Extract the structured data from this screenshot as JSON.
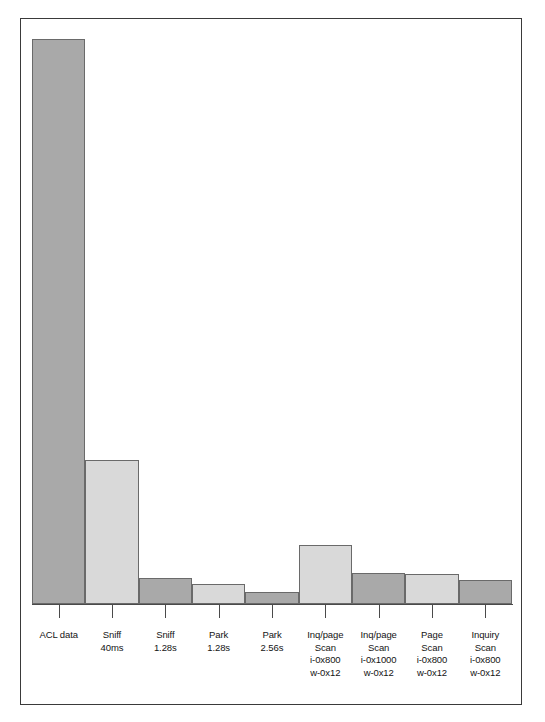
{
  "figure": {
    "background_color": "#ffffff",
    "frame_color": "#3a3a3a",
    "bar_dark_color": "#a9a9a9",
    "bar_light_color": "#d9d9d9",
    "bar_edge_color": "#6a6a6a",
    "axis_color": "#4a4a4a",
    "label_color": "#141414"
  },
  "chart_data": {
    "type": "bar",
    "title": "",
    "subtitle": "",
    "xlabel": "",
    "ylabel": "",
    "grid": false,
    "legend": null,
    "ylim": [
      0,
      100
    ],
    "axis_tick_labels_y": [],
    "categories": [
      "ACL data",
      "Sniff 40ms",
      "Sniff 1.28s",
      "Park 1.28s",
      "Park 2.56s",
      "Inq/page Scan i-0x800 w-0x12",
      "Inq/page Scan i-0x1000 w-0x12",
      "Page Scan i-0x800 w-0x12",
      "Inquiry Scan i-0x800 w-0x12"
    ],
    "category_lines": [
      [
        "ACL data"
      ],
      [
        "Sniff",
        "40ms"
      ],
      [
        "Sniff",
        "1.28s"
      ],
      [
        "Park",
        "1.28s"
      ],
      [
        "Park",
        "2.56s"
      ],
      [
        "Inq/page",
        "Scan",
        "i-0x800",
        "w-0x12"
      ],
      [
        "Inq/page",
        "Scan",
        "i-0x1000",
        "w-0x12"
      ],
      [
        "Page",
        "Scan",
        "i-0x800",
        "w-0x12"
      ],
      [
        "Inquiry",
        "Scan",
        "i-0x800",
        "w-0x12"
      ]
    ],
    "values": [
      97.0,
      24.7,
      4.5,
      3.4,
      2.1,
      10.1,
      5.3,
      5.1,
      4.1
    ],
    "bar_shades": [
      "dark",
      "light",
      "dark",
      "light",
      "dark",
      "light",
      "dark",
      "light",
      "dark"
    ]
  }
}
